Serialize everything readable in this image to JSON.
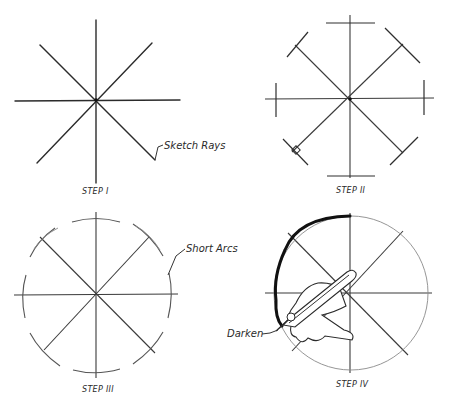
{
  "figure": {
    "panels": [
      {
        "id": "step-1",
        "label": "STEP I",
        "annotation": "Sketch Rays",
        "description": "Eight radial rays sketched through the center"
      },
      {
        "id": "step-2",
        "label": "STEP II",
        "description": "Radius marked off on each ray with short cross ticks"
      },
      {
        "id": "step-3",
        "label": "STEP III",
        "annotation": "Short Arcs",
        "description": "Short arcs sketched through the radius marks"
      },
      {
        "id": "step-4",
        "label": "STEP IV",
        "annotation": "Darken",
        "description": "Hand holding pencil darkens the final circle"
      }
    ],
    "colors": {
      "line": "#2b2b2b",
      "dark_line": "#111111",
      "background": "#ffffff"
    }
  }
}
